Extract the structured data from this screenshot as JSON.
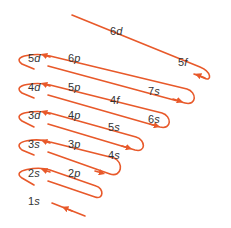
{
  "diagram": {
    "line_color": "#e8592a",
    "text_color": "#333333",
    "orbitals": [
      {
        "id": "1s",
        "n": "1",
        "l": "s",
        "x": 30,
        "y": 198
      },
      {
        "id": "2s",
        "n": "2",
        "l": "s",
        "x": 30,
        "y": 170
      },
      {
        "id": "2p",
        "n": "2",
        "l": "p",
        "x": 70,
        "y": 170
      },
      {
        "id": "3s",
        "n": "3",
        "l": "s",
        "x": 30,
        "y": 141
      },
      {
        "id": "3p",
        "n": "3",
        "l": "p",
        "x": 70,
        "y": 141
      },
      {
        "id": "4s",
        "n": "4",
        "l": "s",
        "x": 110,
        "y": 152
      },
      {
        "id": "3d",
        "n": "3",
        "l": "d",
        "x": 30,
        "y": 112
      },
      {
        "id": "4p",
        "n": "4",
        "l": "p",
        "x": 70,
        "y": 112
      },
      {
        "id": "5s",
        "n": "5",
        "l": "s",
        "x": 110,
        "y": 124
      },
      {
        "id": "4d",
        "n": "4",
        "l": "d",
        "x": 30,
        "y": 84
      },
      {
        "id": "5p",
        "n": "5",
        "l": "p",
        "x": 70,
        "y": 84
      },
      {
        "id": "6s",
        "n": "6",
        "l": "s",
        "x": 150,
        "y": 116
      },
      {
        "id": "4f",
        "n": "4",
        "l": "f",
        "x": 112,
        "y": 97
      },
      {
        "id": "5d",
        "n": "5",
        "l": "d",
        "x": 30,
        "y": 55
      },
      {
        "id": "6p",
        "n": "6",
        "l": "p",
        "x": 70,
        "y": 55
      },
      {
        "id": "7s",
        "n": "7",
        "l": "s",
        "x": 150,
        "y": 88
      },
      {
        "id": "6d",
        "n": "6",
        "l": "d",
        "x": 112,
        "y": 28
      },
      {
        "id": "5f",
        "n": "5",
        "l": "f",
        "x": 180,
        "y": 59
      }
    ],
    "filling_order": [
      "1s",
      "2s",
      "2p",
      "3s",
      "3p",
      "4s",
      "3d",
      "4p",
      "5s",
      "4d",
      "5p",
      "6s",
      "4f",
      "5d",
      "6p",
      "7s",
      "5f",
      "6d"
    ]
  }
}
